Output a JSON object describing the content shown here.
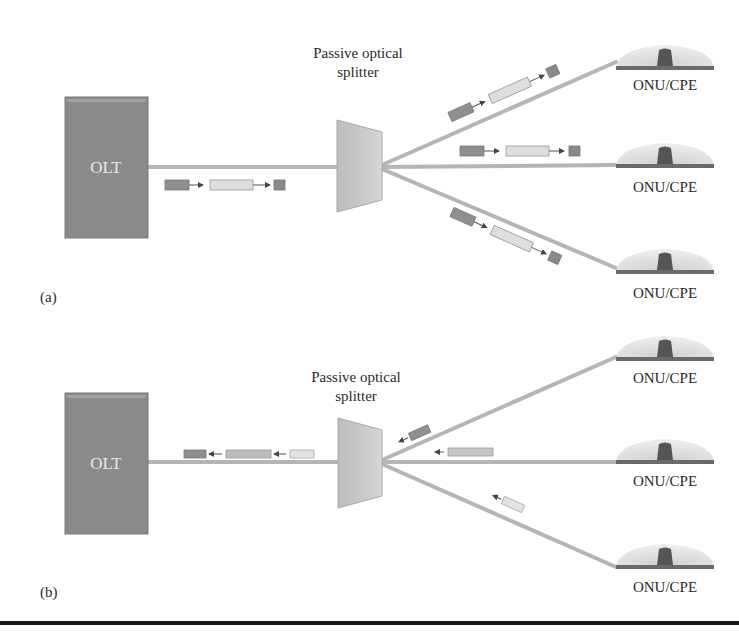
{
  "diagram": {
    "colors": {
      "olt_fill": "#8a8a8a",
      "fiber": "#b7b7b7",
      "splitter_fill": "#c4c4c4",
      "onu_dome": "#dcdcdc",
      "onu_core": "#555555",
      "packet_dark": "#8c8c8c",
      "packet_light": "#dedede",
      "rule": "#1a1a1a"
    },
    "panels": [
      {
        "label": "(a)",
        "direction": "downstream",
        "olt": {
          "label": "OLT"
        },
        "splitter": {
          "label_line1": "Passive optical",
          "label_line2": "splitter"
        },
        "onus": [
          {
            "label": "ONU/CPE"
          },
          {
            "label": "ONU/CPE"
          },
          {
            "label": "ONU/CPE"
          }
        ],
        "packet_sequences": [
          {
            "location": "olt-to-splitter",
            "arrows": "right"
          },
          {
            "location": "branch-top",
            "arrows": "toward-onu"
          },
          {
            "location": "branch-middle",
            "arrows": "toward-onu"
          },
          {
            "location": "branch-bottom",
            "arrows": "toward-onu"
          }
        ]
      },
      {
        "label": "(b)",
        "direction": "upstream",
        "olt": {
          "label": "OLT"
        },
        "splitter": {
          "label_line1": "Passive optical",
          "label_line2": "splitter"
        },
        "onus": [
          {
            "label": "ONU/CPE"
          },
          {
            "label": "ONU/CPE"
          },
          {
            "label": "ONU/CPE"
          }
        ],
        "packet_sequences": [
          {
            "location": "splitter-to-olt",
            "arrows": "left"
          },
          {
            "location": "branch-top",
            "arrows": "toward-splitter"
          },
          {
            "location": "branch-middle",
            "arrows": "toward-splitter"
          },
          {
            "location": "branch-bottom",
            "arrows": "toward-splitter"
          }
        ]
      }
    ]
  }
}
